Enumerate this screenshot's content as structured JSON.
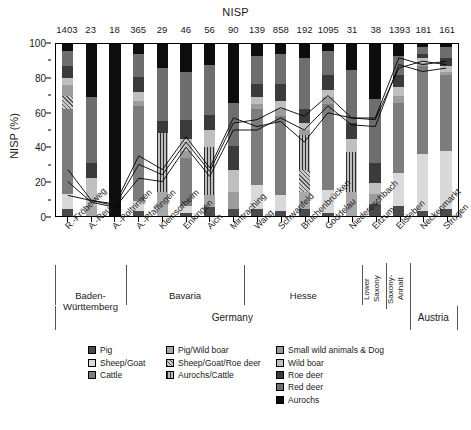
{
  "chart_title": "NISP",
  "yaxis": {
    "label": "NISP (%)",
    "ticks": [
      0,
      20,
      40,
      60,
      80,
      100
    ],
    "minor_ticks": [
      10,
      30,
      50,
      70,
      90
    ],
    "min": 0,
    "max": 100
  },
  "legend": {
    "items": [
      {
        "label": "Pig",
        "swatch": "p-pig",
        "color": "#4a4a4a"
      },
      {
        "label": "Sheep/Goat",
        "swatch": "p-sheepgoat",
        "color": "#d9d9d9"
      },
      {
        "label": "Cattle",
        "swatch": "p-cattle",
        "color": "#7d7d7d"
      },
      {
        "label": "Pig/Wild boar",
        "swatch": "p-pigwild",
        "color": "#a8a8a8"
      },
      {
        "label": "Sheep/Goat/Roe deer",
        "swatch": "p-sgroe",
        "color": "#8a8a8a"
      },
      {
        "label": "Aurochs/Cattle",
        "swatch": "p-aucat",
        "color": "#5a5a5a"
      },
      {
        "label": "Small wild animals & Dog",
        "swatch": "p-small",
        "color": "#9c9c9c"
      },
      {
        "label": "Wild boar",
        "swatch": "p-wildboar",
        "color": "#bfbfbf"
      },
      {
        "label": "Roe deer",
        "swatch": "p-roedeer",
        "color": "#3b3b3b"
      },
      {
        "label": "Red deer",
        "swatch": "p-reddeer",
        "color": "#6e6e6e"
      },
      {
        "label": "Aurochs",
        "swatch": "p-aurochs",
        "color": "#0d0d0d"
      }
    ]
  },
  "regions": [
    {
      "label": "Baden-Württemberg",
      "start": 0,
      "end": 3,
      "vertical": false
    },
    {
      "label": "Bavaria",
      "start": 3,
      "end": 8,
      "vertical": false
    },
    {
      "label": "Hesse",
      "start": 8,
      "end": 13,
      "vertical": false
    },
    {
      "label": "Lower Saxony",
      "start": 13,
      "end": 14,
      "vertical": true
    },
    {
      "label": "Saxony-Anhalt",
      "start": 14,
      "end": 15,
      "vertical": true
    }
  ],
  "countries": [
    {
      "label": "Germany",
      "start": 0,
      "end": 15
    },
    {
      "label": "Austria",
      "start": 15,
      "end": 17
    }
  ],
  "chart_data": {
    "type": "bar",
    "title": "NISP",
    "xlabel": "",
    "ylabel": "NISP (%)",
    "ylim": [
      0,
      100
    ],
    "grid": false,
    "legend_position": "bottom",
    "stacked": true,
    "categories": [
      "R.-Fröbelweg",
      "A.-Reusten",
      "A.-Poltringen",
      "A.-Pfaffingen",
      "Kleinsorheim",
      "Enkingen",
      "Aich",
      "Mintraching",
      "Wang",
      "Schwanfeld",
      "Bruchenbrücken",
      "Goddelau",
      "Niedereschbach",
      "Eitzum",
      "Eilsleben",
      "Neckenmarkt",
      "Strögen"
    ],
    "nisp_totals": [
      1403,
      23,
      18,
      365,
      29,
      46,
      56,
      90,
      139,
      858,
      192,
      1095,
      31,
      38,
      1393,
      181,
      161
    ],
    "series": [
      {
        "name": "Pig",
        "values": [
          4,
          0,
          0,
          3,
          0,
          2,
          5,
          4,
          4,
          3,
          4,
          2,
          0,
          7,
          6,
          3,
          4
        ]
      },
      {
        "name": "Sheep/Goat",
        "values": [
          9,
          0,
          0,
          6,
          0,
          4,
          0,
          0,
          14,
          9,
          0,
          13,
          0,
          0,
          19,
          33,
          34
        ]
      },
      {
        "name": "Cattle",
        "values": [
          49,
          0,
          0,
          55,
          0,
          28,
          0,
          0,
          44,
          46,
          0,
          50,
          0,
          0,
          41,
          51,
          44
        ]
      },
      {
        "name": "Pig/Wild boar",
        "values": [
          0,
          6,
          0,
          0,
          14,
          0,
          7,
          0,
          0,
          0,
          10,
          0,
          14,
          0,
          0,
          0,
          0
        ]
      },
      {
        "name": "Sheep/Goat/Roe deer",
        "values": [
          8,
          0,
          0,
          0,
          0,
          0,
          0,
          0,
          0,
          0,
          13,
          0,
          0,
          0,
          0,
          0,
          0
        ]
      },
      {
        "name": "Aurochs/Cattle",
        "values": [
          0,
          0,
          0,
          0,
          34,
          0,
          28,
          0,
          0,
          0,
          20,
          0,
          23,
          0,
          0,
          0,
          0
        ]
      },
      {
        "name": "Small wild animals & Dog",
        "values": [
          6,
          0,
          0,
          3,
          0,
          4,
          0,
          10,
          3,
          4,
          3,
          4,
          0,
          6,
          4,
          2,
          2
        ]
      },
      {
        "name": "Wild boar",
        "values": [
          4,
          16,
          0,
          5,
          0,
          7,
          10,
          13,
          4,
          5,
          4,
          4,
          8,
          6,
          5,
          3,
          3
        ]
      },
      {
        "name": "Roe deer",
        "values": [
          7,
          9,
          0,
          9,
          7,
          11,
          9,
          14,
          8,
          10,
          8,
          9,
          9,
          12,
          7,
          2,
          5
        ]
      },
      {
        "name": "Red deer",
        "values": [
          9,
          38,
          0,
          13,
          31,
          28,
          29,
          25,
          16,
          17,
          30,
          14,
          31,
          37,
          11,
          4,
          6
        ]
      },
      {
        "name": "Aurochs",
        "values": [
          4,
          31,
          100,
          6,
          14,
          16,
          12,
          34,
          7,
          6,
          8,
          4,
          15,
          32,
          7,
          2,
          2
        ]
      }
    ],
    "overlay_lines": [
      {
        "name": "line-1",
        "values": [
          12,
          9,
          6,
          30,
          24,
          43,
          26,
          54,
          56,
          63,
          58,
          70,
          57,
          57,
          92,
          88,
          90
        ]
      },
      {
        "name": "line-2",
        "values": [
          20,
          8,
          5,
          22,
          20,
          40,
          23,
          50,
          50,
          57,
          50,
          64,
          53,
          52,
          88,
          84,
          86
        ]
      },
      {
        "name": "line-3",
        "values": [
          27,
          9,
          7,
          35,
          27,
          46,
          28,
          57,
          52,
          55,
          43,
          60,
          57,
          56,
          86,
          90,
          88
        ]
      }
    ]
  }
}
